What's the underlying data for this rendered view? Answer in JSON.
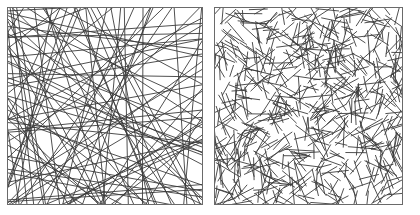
{
  "figure": {
    "panels": [
      {
        "id": "long-fibers",
        "description": "Random network of long straight fibers spanning the square",
        "fiber_count": 95,
        "fiber_type": "long",
        "stroke_color": "#3a3a3a",
        "stroke_width": 0.9,
        "seed": 17
      },
      {
        "id": "short-fibers",
        "description": "Random network of many short straight fiber segments",
        "fiber_count": 650,
        "fiber_type": "short",
        "segment_length": 24,
        "stroke_color": "#3a3a3a",
        "stroke_width": 0.9,
        "seed": 42
      }
    ],
    "border_color": "#6a6a6a",
    "background": "#ffffff"
  }
}
